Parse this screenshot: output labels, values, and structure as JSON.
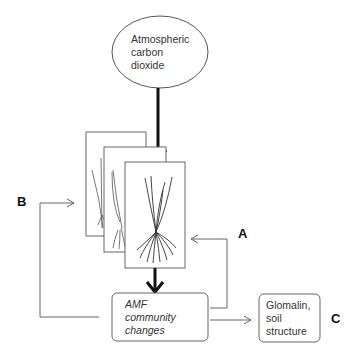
{
  "diagram": {
    "nodes": {
      "co2": {
        "lines": [
          "Atmospheric",
          "carbon",
          "dioxide"
        ],
        "shape": "ellipse"
      },
      "plants": {
        "shape": "stacked-cards",
        "count": 3,
        "depicts": "grass-plants-with-roots"
      },
      "amf": {
        "lines": [
          "AMF",
          "community",
          "changes"
        ],
        "shape": "rounded-rect",
        "style": "italic"
      },
      "glomalin": {
        "lines": [
          "Glomalin,",
          "soil",
          "structure"
        ],
        "shape": "rounded-rect"
      }
    },
    "labels": {
      "a": "A",
      "b": "B",
      "c": "C"
    },
    "edges": [
      {
        "from": "co2",
        "to": "plants",
        "style": "thick"
      },
      {
        "from": "plants",
        "to": "amf",
        "style": "thick"
      },
      {
        "from": "amf",
        "to": "plants",
        "style": "thin",
        "label": "A",
        "side": "right"
      },
      {
        "from": "amf",
        "to": "plants",
        "style": "thin",
        "label": "B",
        "side": "left"
      },
      {
        "from": "amf",
        "to": "glomalin",
        "style": "thin",
        "label": "C"
      }
    ],
    "colors": {
      "stroke": "#555555",
      "thick_stroke": "#111111",
      "text": "#333333"
    }
  }
}
